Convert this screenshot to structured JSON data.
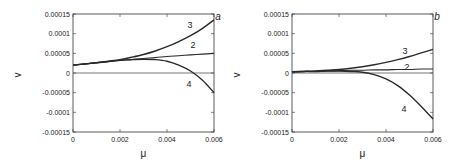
{
  "chart_data": [
    {
      "type": "line",
      "panel": "a",
      "xlabel": "μ",
      "ylabel": "v",
      "xlim": [
        0,
        0.006
      ],
      "ylim": [
        -0.00015,
        0.00015
      ],
      "xticks": [
        "0",
        "0.002",
        "0.004",
        "0.006"
      ],
      "yticks": [
        "0.00015",
        "0.0001",
        "0.00005",
        "0",
        "-0.00005",
        "-0.0001",
        "-0.00015"
      ],
      "grid": false,
      "zero_line": true,
      "x": [
        0,
        0.0005,
        0.001,
        0.0015,
        0.002,
        0.0025,
        0.003,
        0.0035,
        0.004,
        0.0045,
        0.005,
        0.0055,
        0.006
      ],
      "series": [
        {
          "name": "3",
          "values": [
            2e-05,
            2.3e-05,
            2.6e-05,
            3e-05,
            3.4e-05,
            4e-05,
            4.7e-05,
            5.6e-05,
            6.7e-05,
            8e-05,
            9.5e-05,
            0.000113,
            0.000135
          ]
        },
        {
          "name": "2",
          "values": [
            2e-05,
            2.3e-05,
            2.6e-05,
            2.9e-05,
            3.2e-05,
            3.4e-05,
            3.7e-05,
            3.9e-05,
            4.2e-05,
            4.4e-05,
            4.6e-05,
            4.8e-05,
            5e-05
          ]
        },
        {
          "name": "4",
          "values": [
            2e-05,
            2.3e-05,
            2.6e-05,
            2.9e-05,
            3.2e-05,
            3.4e-05,
            3.5e-05,
            3.4e-05,
            3e-05,
            2e-05,
            5e-06,
            -1.8e-05,
            -5e-05
          ]
        }
      ]
    },
    {
      "type": "line",
      "panel": "b",
      "xlabel": "μ",
      "ylabel": "v",
      "xlim": [
        0,
        0.006
      ],
      "ylim": [
        -0.00015,
        0.00015
      ],
      "xticks": [
        "0",
        "0.002",
        "0.004",
        "0.006"
      ],
      "yticks": [
        "0.00015",
        "0.0001",
        "0.00005",
        "0",
        "-0.00005",
        "-0.0001",
        "-0.00015"
      ],
      "grid": false,
      "zero_line": true,
      "x": [
        0,
        0.0005,
        0.001,
        0.0015,
        0.002,
        0.0025,
        0.003,
        0.0035,
        0.004,
        0.0045,
        0.005,
        0.0055,
        0.006
      ],
      "series": [
        {
          "name": "3",
          "values": [
            3e-06,
            4e-06,
            5e-06,
            7e-06,
            9e-06,
            1.2e-05,
            1.6e-05,
            2.1e-05,
            2.7e-05,
            3.4e-05,
            4.2e-05,
            5.1e-05,
            6e-05
          ]
        },
        {
          "name": "2",
          "values": [
            3e-06,
            4e-06,
            4e-06,
            5e-06,
            6e-06,
            7e-06,
            7e-06,
            8e-06,
            8e-06,
            9e-06,
            9e-06,
            1e-05,
            1e-05
          ]
        },
        {
          "name": "4",
          "values": [
            3e-06,
            4e-06,
            4e-06,
            5e-06,
            5e-06,
            4e-06,
            2e-06,
            -4e-06,
            -1.5e-05,
            -3.2e-05,
            -5.6e-05,
            -8.5e-05,
            -0.000117
          ]
        }
      ]
    }
  ],
  "panels": [
    {
      "label": "a",
      "curve_labels": {
        "3": "3",
        "2": "2",
        "4": "4"
      }
    },
    {
      "label": "b",
      "curve_labels": {
        "3": "3",
        "2": "2",
        "4": "4"
      }
    }
  ]
}
